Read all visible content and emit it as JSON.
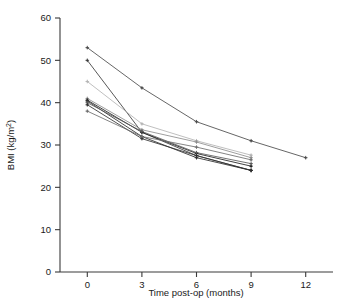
{
  "chart_data": {
    "type": "line",
    "title": "",
    "subtitle": "",
    "xlabel": "Time post-op (months)",
    "ylabel": "BMI (kg/m²)",
    "ylabel_base": "BMI (kg/m",
    "ylabel_sup": "2",
    "ylabel_close": ")",
    "xlim": [
      -1.5,
      13.5
    ],
    "ylim": [
      0,
      60
    ],
    "xticks": [
      0,
      3,
      6,
      9,
      12
    ],
    "xtick_labels": [
      "0",
      "3",
      "6",
      "9",
      "12"
    ],
    "yticks": [
      0,
      10,
      20,
      30,
      40,
      50,
      60
    ],
    "ytick_labels": [
      "0",
      "10",
      "20",
      "30",
      "40",
      "50",
      "60"
    ],
    "grid": false,
    "legend": "none",
    "marker": "cross-dot",
    "x": [
      0,
      3,
      6,
      9,
      12
    ],
    "series": [
      {
        "name": "Patient 1",
        "color": "#4a4a4a",
        "x": [
          0,
          3,
          6,
          9,
          12
        ],
        "values": [
          53.0,
          43.5,
          35.5,
          31.0,
          27.0
        ]
      },
      {
        "name": "Patient 2",
        "color": "#3a3a3a",
        "x": [
          0,
          3,
          6,
          9
        ],
        "values": [
          50.0,
          33.0,
          27.5,
          24.0
        ]
      },
      {
        "name": "Patient 3",
        "color": "#b4b4b4",
        "x": [
          0,
          3,
          6,
          9
        ],
        "values": [
          45.0,
          35.0,
          31.0,
          27.6
        ]
      },
      {
        "name": "Patient 4",
        "color": "#8c8c8c",
        "x": [
          0,
          3,
          6,
          9
        ],
        "values": [
          41.0,
          33.6,
          30.7,
          27.0
        ]
      },
      {
        "name": "Patient 5",
        "color": "#1f1f1f",
        "x": [
          0,
          3,
          6,
          9
        ],
        "values": [
          40.6,
          33.0,
          28.0,
          25.0
        ]
      },
      {
        "name": "Patient 6",
        "color": "#2b2b2b",
        "x": [
          0,
          3,
          6,
          9
        ],
        "values": [
          40.4,
          32.0,
          27.0,
          24.0
        ]
      },
      {
        "name": "Patient 7",
        "color": "#5a5a5a",
        "x": [
          0,
          3,
          6,
          9
        ],
        "values": [
          40.0,
          33.2,
          28.2,
          25.6
        ]
      },
      {
        "name": "Patient 8",
        "color": "#303030",
        "x": [
          0,
          3,
          6,
          9
        ],
        "values": [
          39.5,
          31.5,
          27.5,
          24.0
        ]
      },
      {
        "name": "Patient 9",
        "color": "#6e6e6e",
        "x": [
          0,
          3,
          6,
          9
        ],
        "values": [
          38.0,
          32.0,
          29.5,
          26.5
        ]
      }
    ]
  },
  "colors": {
    "axis": "#3a3a3a",
    "text": "#1a1a1a",
    "background": "#ffffff"
  }
}
